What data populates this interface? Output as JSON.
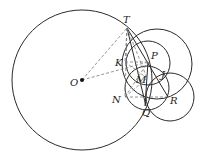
{
  "diagram": {
    "stroke_color": "#2a2a2a",
    "dash_color": "#777777",
    "points": {
      "T": {
        "label": "T",
        "x": 127,
        "y": 28,
        "lx": 123,
        "ly": 23
      },
      "O": {
        "label": "O",
        "x": 82,
        "y": 80,
        "lx": 70,
        "ly": 86
      },
      "K": {
        "label": "K",
        "x": 125,
        "y": 62,
        "lx": 115,
        "ly": 66
      },
      "P": {
        "label": "P",
        "x": 148,
        "y": 62,
        "lx": 151,
        "ly": 59
      },
      "M": {
        "label": "M",
        "x": 147,
        "y": 78,
        "lx": 136,
        "ly": 83
      },
      "J": {
        "label": "J",
        "x": 160,
        "y": 76,
        "lx": 161,
        "ly": 78
      },
      "N": {
        "label": "N",
        "x": 125,
        "y": 97,
        "lx": 112,
        "ly": 103
      },
      "R": {
        "label": "R",
        "x": 168,
        "y": 97,
        "lx": 170,
        "ly": 104
      },
      "Q": {
        "label": "Q",
        "x": 146,
        "y": 106,
        "lx": 142,
        "ly": 116
      }
    }
  }
}
